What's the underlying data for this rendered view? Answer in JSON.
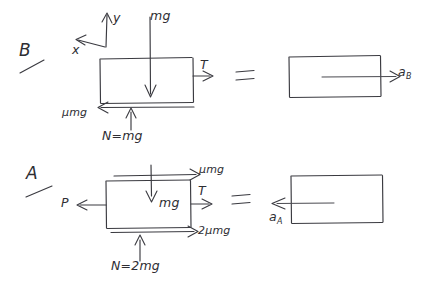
{
  "figure": {
    "kind": "hand-drawn-free-body-diagram",
    "background_color": "#ffffff",
    "ink_color": "#3a3a40"
  },
  "axes": {
    "y_label": "y",
    "x_label": "x",
    "y_direction": "up",
    "x_direction": "left"
  },
  "rows": {
    "b": {
      "case_label": "B",
      "equals": "=",
      "fbd": {
        "weight": "mg",
        "tension": "T",
        "friction": "μmg",
        "normal": "N=mg"
      },
      "result": {
        "acceleration": "a",
        "acceleration_sub": "B"
      }
    },
    "a": {
      "case_label": "A",
      "equals": "=",
      "fbd": {
        "top_friction": "μmg",
        "applied": "P",
        "weight": "mg",
        "tension": "T",
        "bottom_friction": "2μmg",
        "normal": "N=2mg"
      },
      "result": {
        "acceleration": "a",
        "acceleration_sub": "A"
      }
    }
  }
}
